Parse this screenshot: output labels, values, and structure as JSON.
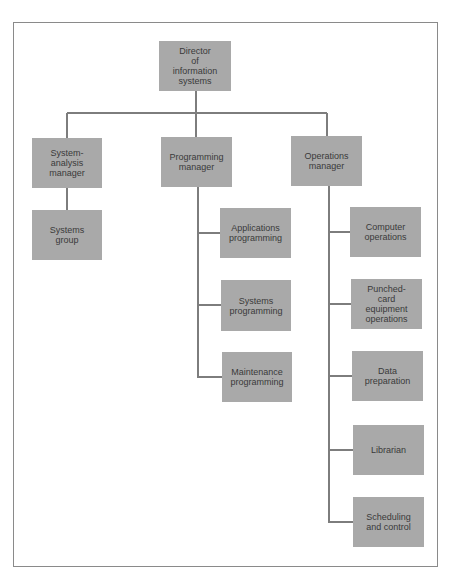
{
  "diagram": {
    "type": "org-chart",
    "colors": {
      "box_fill": "#a9a9a9",
      "line": "#7d7d7d",
      "text": "#3a3a3a",
      "frame": "#8a8a8a"
    },
    "root": {
      "id": "director",
      "label": "Director\nof\ninformation\nsystems"
    },
    "managers": [
      {
        "id": "system-analysis-manager",
        "label": "System-\nanalysis\nmanager",
        "reports": [
          {
            "id": "systems-group",
            "label": "Systems\ngroup"
          }
        ]
      },
      {
        "id": "programming-manager",
        "label": "Programming\nmanager",
        "reports": [
          {
            "id": "applications-programming",
            "label": "Applications\nprogramming"
          },
          {
            "id": "systems-programming",
            "label": "Systems\nprogramming"
          },
          {
            "id": "maintenance-programming",
            "label": "Maintenance\nprogramming"
          }
        ]
      },
      {
        "id": "operations-manager",
        "label": "Operations\nmanager",
        "reports": [
          {
            "id": "computer-operations",
            "label": "Computer\noperations"
          },
          {
            "id": "punched-card-equipment-operations",
            "label": "Punched-\ncard\nequipment\noperations"
          },
          {
            "id": "data-preparation",
            "label": "Data\npreparation"
          },
          {
            "id": "librarian",
            "label": "Librarian"
          },
          {
            "id": "scheduling-and-control",
            "label": "Scheduling\nand control"
          }
        ]
      }
    ]
  }
}
